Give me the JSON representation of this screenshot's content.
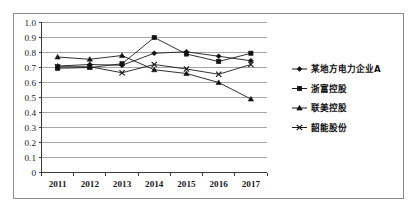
{
  "chart_data": {
    "type": "line",
    "title": "",
    "subtitle": "",
    "xlabel": "",
    "ylabel": "",
    "categories": [
      "2011",
      "2012",
      "2013",
      "2014",
      "2015",
      "2016",
      "2017"
    ],
    "ylim": [
      0,
      1.0
    ],
    "y_ticks": [
      "1.0",
      "0.9",
      "0.8",
      "0.7",
      "0.6",
      "0.5",
      "0.4",
      "0.3",
      "0.2",
      "0.1",
      "0"
    ],
    "y_tick_values": [
      1.0,
      0.9,
      0.8,
      0.7,
      0.6,
      0.5,
      0.4,
      0.3,
      0.2,
      0.1,
      0
    ],
    "grid": "horizontal",
    "legend_position": "right",
    "series": [
      {
        "name": "某地方电力企业A",
        "marker": "diamond",
        "color": "#111111",
        "values": [
          0.71,
          0.72,
          0.715,
          0.795,
          0.805,
          0.775,
          0.745
        ]
      },
      {
        "name": "浙富控股",
        "marker": "square",
        "color": "#111111",
        "values": [
          0.695,
          0.7,
          0.725,
          0.9,
          0.79,
          0.74,
          0.795
        ]
      },
      {
        "name": "联美控股",
        "marker": "triangle",
        "color": "#111111",
        "values": [
          0.77,
          0.755,
          0.78,
          0.685,
          0.66,
          0.6,
          0.49
        ]
      },
      {
        "name": "韶能股份",
        "marker": "x",
        "color": "#111111",
        "values": [
          0.705,
          0.705,
          0.665,
          0.72,
          0.69,
          0.655,
          0.72
        ]
      }
    ]
  },
  "legend": {
    "items": [
      {
        "label": "某地方电力企业A",
        "marker": "diamond"
      },
      {
        "label": "浙富控股",
        "marker": "square"
      },
      {
        "label": "联美控股",
        "marker": "triangle"
      },
      {
        "label": "韶能股份",
        "marker": "x"
      }
    ]
  }
}
